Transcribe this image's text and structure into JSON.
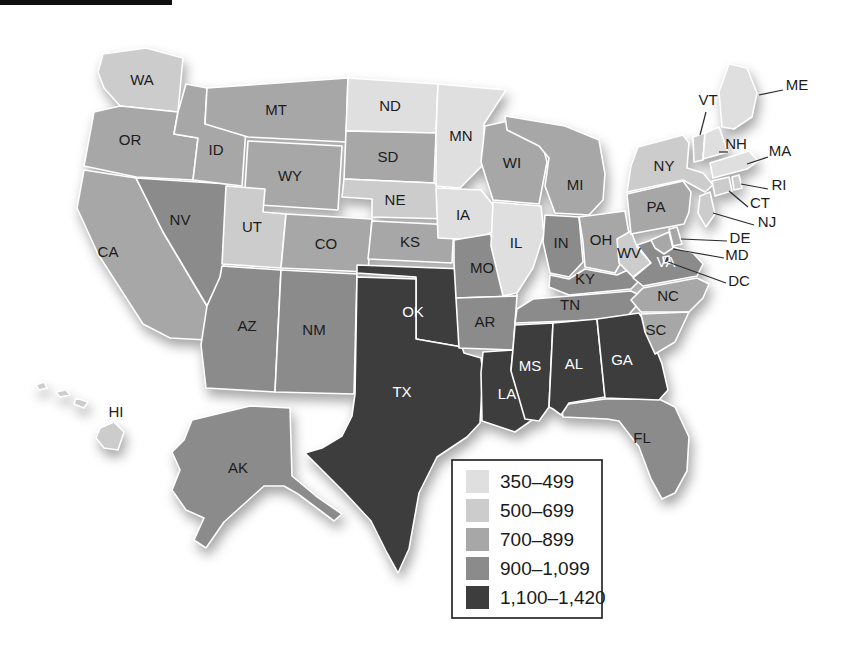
{
  "legend": {
    "items": [
      {
        "label": "350–499",
        "color": "#dfdfdf"
      },
      {
        "label": "500–699",
        "color": "#cccccc"
      },
      {
        "label": "700–899",
        "color": "#a7a7a7"
      },
      {
        "label": "900–1,099",
        "color": "#8b8b8b"
      },
      {
        "label": "1,100–1,420",
        "color": "#3d3d3d"
      }
    ],
    "border_color": "#1a1a1a"
  },
  "map": {
    "label_color_dark": "#1c1c1c",
    "label_color_light": "#ffffff",
    "state_border_color": "#ffffff",
    "states": [
      {
        "abbr": "WA",
        "range": "500–699",
        "color": "#cccccc",
        "label_style": "dark"
      },
      {
        "abbr": "OR",
        "range": "700–899",
        "color": "#a7a7a7",
        "label_style": "dark"
      },
      {
        "abbr": "CA",
        "range": "700–899",
        "color": "#a7a7a7",
        "label_style": "dark"
      },
      {
        "abbr": "NV",
        "range": "900–1,099",
        "color": "#8b8b8b",
        "label_style": "dark"
      },
      {
        "abbr": "ID",
        "range": "700–899",
        "color": "#a7a7a7",
        "label_style": "dark"
      },
      {
        "abbr": "MT",
        "range": "700–899",
        "color": "#a7a7a7",
        "label_style": "dark"
      },
      {
        "abbr": "WY",
        "range": "700–899",
        "color": "#a7a7a7",
        "label_style": "dark"
      },
      {
        "abbr": "UT",
        "range": "500–699",
        "color": "#cccccc",
        "label_style": "dark"
      },
      {
        "abbr": "CO",
        "range": "700–899",
        "color": "#a7a7a7",
        "label_style": "dark"
      },
      {
        "abbr": "AZ",
        "range": "900–1,099",
        "color": "#8b8b8b",
        "label_style": "dark"
      },
      {
        "abbr": "NM",
        "range": "900–1,099",
        "color": "#8b8b8b",
        "label_style": "dark"
      },
      {
        "abbr": "ND",
        "range": "350–499",
        "color": "#dfdfdf",
        "label_style": "dark"
      },
      {
        "abbr": "SD",
        "range": "700–899",
        "color": "#a7a7a7",
        "label_style": "dark"
      },
      {
        "abbr": "NE",
        "range": "500–699",
        "color": "#cccccc",
        "label_style": "dark"
      },
      {
        "abbr": "KS",
        "range": "700–899",
        "color": "#a7a7a7",
        "label_style": "dark"
      },
      {
        "abbr": "OK",
        "range": "1,100–1,420",
        "color": "#3d3d3d",
        "label_style": "light"
      },
      {
        "abbr": "TX",
        "range": "1,100–1,420",
        "color": "#3d3d3d",
        "label_style": "light"
      },
      {
        "abbr": "MN",
        "range": "350–499",
        "color": "#dfdfdf",
        "label_style": "dark"
      },
      {
        "abbr": "IA",
        "range": "350–499",
        "color": "#dfdfdf",
        "label_style": "dark"
      },
      {
        "abbr": "MO",
        "range": "900–1,099",
        "color": "#8b8b8b",
        "label_style": "dark"
      },
      {
        "abbr": "AR",
        "range": "900–1,099",
        "color": "#8b8b8b",
        "label_style": "dark"
      },
      {
        "abbr": "LA",
        "range": "1,100–1,420",
        "color": "#3d3d3d",
        "label_style": "light"
      },
      {
        "abbr": "WI",
        "range": "700–899",
        "color": "#a7a7a7",
        "label_style": "dark"
      },
      {
        "abbr": "IL",
        "range": "350–499",
        "color": "#dfdfdf",
        "label_style": "dark"
      },
      {
        "abbr": "MI",
        "range": "700–899",
        "color": "#a7a7a7",
        "label_style": "dark"
      },
      {
        "abbr": "IN",
        "range": "900–1,099",
        "color": "#8b8b8b",
        "label_style": "dark"
      },
      {
        "abbr": "OH",
        "range": "700–899",
        "color": "#a7a7a7",
        "label_style": "dark"
      },
      {
        "abbr": "KY",
        "range": "900–1,099",
        "color": "#8b8b8b",
        "label_style": "dark"
      },
      {
        "abbr": "TN",
        "range": "900–1,099",
        "color": "#8b8b8b",
        "label_style": "dark"
      },
      {
        "abbr": "MS",
        "range": "1,100–1,420",
        "color": "#3d3d3d",
        "label_style": "light"
      },
      {
        "abbr": "AL",
        "range": "1,100–1,420",
        "color": "#3d3d3d",
        "label_style": "light"
      },
      {
        "abbr": "GA",
        "range": "1,100–1,420",
        "color": "#3d3d3d",
        "label_style": "light"
      },
      {
        "abbr": "FL",
        "range": "900–1,099",
        "color": "#8b8b8b",
        "label_style": "dark"
      },
      {
        "abbr": "WV",
        "range": "500–699",
        "color": "#cccccc",
        "label_style": "dark"
      },
      {
        "abbr": "VA",
        "range": "900–1,099",
        "color": "#8b8b8b",
        "label_style": "light"
      },
      {
        "abbr": "NC",
        "range": "700–899",
        "color": "#a7a7a7",
        "label_style": "dark"
      },
      {
        "abbr": "SC",
        "range": "700–899",
        "color": "#a7a7a7",
        "label_style": "dark"
      },
      {
        "abbr": "PA",
        "range": "700–899",
        "color": "#a7a7a7",
        "label_style": "dark"
      },
      {
        "abbr": "NY",
        "range": "500–699",
        "color": "#cccccc",
        "label_style": "dark"
      },
      {
        "abbr": "NJ",
        "range": "500–699",
        "color": "#cccccc",
        "label_style": "dark"
      },
      {
        "abbr": "CT",
        "range": "500–699",
        "color": "#cccccc",
        "label_style": "dark"
      },
      {
        "abbr": "RI",
        "range": "500–699",
        "color": "#cccccc",
        "label_style": "dark"
      },
      {
        "abbr": "MA",
        "range": "350–499",
        "color": "#dfdfdf",
        "label_style": "dark"
      },
      {
        "abbr": "VT",
        "range": "500–699",
        "color": "#cccccc",
        "label_style": "dark"
      },
      {
        "abbr": "NH",
        "range": "350–499",
        "color": "#dfdfdf",
        "label_style": "dark"
      },
      {
        "abbr": "ME",
        "range": "350–499",
        "color": "#dfdfdf",
        "label_style": "dark"
      },
      {
        "abbr": "MD",
        "range": "700–899",
        "color": "#a7a7a7",
        "label_style": "dark"
      },
      {
        "abbr": "DE",
        "range": "700–899",
        "color": "#a7a7a7",
        "label_style": "dark"
      },
      {
        "abbr": "DC",
        "range": "1,100–1,420",
        "color": "#3d3d3d",
        "label_style": "dark"
      },
      {
        "abbr": "AK",
        "range": "900–1,099",
        "color": "#8b8b8b",
        "label_style": "dark"
      },
      {
        "abbr": "HI",
        "range": "500–699",
        "color": "#cccccc",
        "label_style": "dark"
      }
    ]
  }
}
